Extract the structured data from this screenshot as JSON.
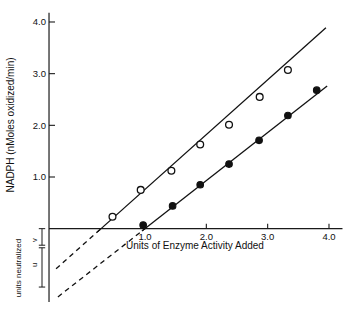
{
  "chart_data": {
    "type": "scatter",
    "title": "",
    "xlabel": "Units of Enzyme Activity Added",
    "ylabel": "NADPH (nMoles oxidized/min)",
    "xlim": [
      -0.55,
      4.25
    ],
    "ylim": [
      -1.45,
      4.15
    ],
    "xticks": [
      1.0,
      2.0,
      3.0,
      4.0
    ],
    "xticklabels": [
      "1.0",
      "2.0",
      "3.0",
      "4.0"
    ],
    "yticks": [
      1.0,
      2.0,
      3.0,
      4.0
    ],
    "yticklabels": [
      "1.0",
      "2.0",
      "3.0",
      "4.0"
    ],
    "grid": false,
    "legend": "none",
    "series": [
      {
        "name": "open-circles",
        "marker": "open-circle",
        "x": [
          0.47,
          0.93,
          1.43,
          1.9,
          2.37,
          2.87,
          3.33
        ],
        "y": [
          0.23,
          0.75,
          1.12,
          1.63,
          2.01,
          2.55,
          3.07
        ],
        "fit": {
          "slope": 1.06,
          "intercept": -0.3,
          "x_start": 0.22,
          "x_end": 3.95
        },
        "fit_dashed": {
          "x_start": -0.45,
          "x_end": 0.3
        }
      },
      {
        "name": "filled-circles",
        "marker": "filled-circle",
        "x": [
          0.97,
          1.45,
          1.9,
          2.37,
          2.86,
          3.33,
          3.8
        ],
        "y": [
          0.07,
          0.44,
          0.85,
          1.25,
          1.71,
          2.19,
          2.68
        ],
        "fit": {
          "slope": 0.93,
          "intercept": -0.93,
          "x_start": 0.95,
          "x_end": 3.97
        },
        "fit_dashed": {
          "x_start": -0.42,
          "x_end": 1.02
        }
      }
    ],
    "annotations": {
      "bracket_label": "units neutralized",
      "segment_upper_label": "v",
      "segment_lower_label": "u"
    }
  }
}
